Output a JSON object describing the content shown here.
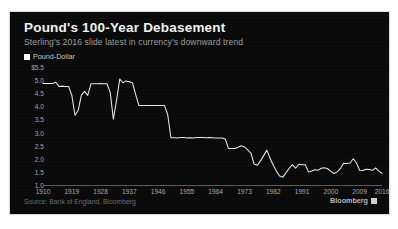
{
  "header": {
    "title": "Pound's 100-Year Debasement",
    "subtitle": "Sterling's 2016 slide latest in currency's downward trend"
  },
  "legend": {
    "swatch_icon": "legend-square-icon",
    "label": "Pound-Dollar",
    "color": "#ffffff"
  },
  "footer": {
    "source": "Source: Bank of England, Bloomberg",
    "brand": "Bloomberg",
    "brand_mark_icon": "bloomberg-square-icon"
  },
  "colors": {
    "panel_background": "#0a0a0a",
    "page_background": "#ffffff",
    "line": "#e8e8e2",
    "axis": "#5a5a5a",
    "tick_text": "#a8a8a8",
    "title_text": "#f2f2f2",
    "subtitle_text": "#9d9d9d",
    "source_text": "#6d6d6d"
  },
  "chart_data": {
    "type": "line",
    "title": "Pound's 100-Year Debasement",
    "subtitle": "Sterling's 2016 slide latest in currency's downward trend",
    "xlabel": "",
    "ylabel": "",
    "xlim": [
      1910,
      2016
    ],
    "ylim": [
      1.0,
      5.5
    ],
    "grid": false,
    "legend_position": "top-left",
    "ytick_labels": [
      "$5.5",
      "5.0",
      "4.5",
      "4.0",
      "3.5",
      "3.0",
      "2.5",
      "2.0",
      "1.5",
      "1.0"
    ],
    "ytick_values": [
      5.5,
      5.0,
      4.5,
      4.0,
      3.5,
      3.0,
      2.5,
      2.0,
      1.5,
      1.0
    ],
    "xtick_labels": [
      "1910",
      "1919",
      "1928",
      "1937",
      "1946",
      "1955",
      "1964",
      "1973",
      "1982",
      "1991",
      "2000",
      "2009",
      "2016"
    ],
    "xtick_values": [
      1910,
      1919,
      1928,
      1937,
      1946,
      1955,
      1964,
      1973,
      1982,
      1991,
      2000,
      2009,
      2016
    ],
    "series": [
      {
        "name": "Pound-Dollar",
        "color": "#e8e8e2",
        "x": [
          1910,
          1911,
          1912,
          1913,
          1914,
          1915,
          1916,
          1917,
          1918,
          1919,
          1920,
          1921,
          1922,
          1923,
          1924,
          1925,
          1926,
          1927,
          1928,
          1929,
          1930,
          1931,
          1932,
          1933,
          1934,
          1935,
          1936,
          1937,
          1938,
          1939,
          1940,
          1941,
          1942,
          1943,
          1944,
          1945,
          1946,
          1947,
          1948,
          1949,
          1950,
          1951,
          1952,
          1953,
          1954,
          1955,
          1956,
          1957,
          1958,
          1959,
          1960,
          1961,
          1962,
          1963,
          1964,
          1965,
          1966,
          1967,
          1968,
          1969,
          1970,
          1971,
          1972,
          1973,
          1974,
          1975,
          1976,
          1977,
          1978,
          1979,
          1980,
          1981,
          1982,
          1983,
          1984,
          1985,
          1986,
          1987,
          1988,
          1989,
          1990,
          1991,
          1992,
          1993,
          1994,
          1995,
          1996,
          1997,
          1998,
          1999,
          2000,
          2001,
          2002,
          2003,
          2004,
          2005,
          2006,
          2007,
          2008,
          2009,
          2010,
          2011,
          2012,
          2013,
          2014,
          2015,
          2016
        ],
        "values": [
          4.87,
          4.87,
          4.87,
          4.87,
          4.92,
          4.76,
          4.77,
          4.76,
          4.76,
          4.43,
          3.66,
          3.85,
          4.43,
          4.57,
          4.42,
          4.86,
          4.86,
          4.86,
          4.87,
          4.86,
          4.86,
          4.54,
          3.51,
          4.24,
          5.04,
          4.9,
          4.97,
          4.94,
          4.89,
          4.44,
          4.03,
          4.03,
          4.03,
          4.03,
          4.03,
          4.03,
          4.03,
          4.03,
          4.03,
          3.68,
          2.8,
          2.8,
          2.79,
          2.81,
          2.81,
          2.79,
          2.8,
          2.79,
          2.81,
          2.81,
          2.81,
          2.8,
          2.81,
          2.8,
          2.79,
          2.79,
          2.79,
          2.75,
          2.39,
          2.39,
          2.39,
          2.44,
          2.5,
          2.45,
          2.34,
          2.22,
          1.8,
          1.75,
          1.92,
          2.12,
          2.33,
          2.02,
          1.75,
          1.52,
          1.34,
          1.3,
          1.47,
          1.64,
          1.78,
          1.64,
          1.79,
          1.77,
          1.77,
          1.5,
          1.53,
          1.58,
          1.56,
          1.64,
          1.66,
          1.62,
          1.52,
          1.44,
          1.5,
          1.63,
          1.83,
          1.82,
          1.84,
          2.0,
          1.85,
          1.56,
          1.55,
          1.6,
          1.59,
          1.56,
          1.65,
          1.53,
          1.45
        ],
        "notes": [
          "Flat near 4.87 gold-standard parity before WWI",
          "Post-WWI slide to ~3.66 in 1920, recovery to 4.86 at 1925 gold-standard return",
          "1931 exit from gold standard; fall to ~3.51 in 1932",
          "Wartime peg at 4.03 from 1940",
          "1949 devaluation step down to 2.80",
          "1967 devaluation step down to 2.39",
          "1970s float and decline, low ~1.75 in 1976",
          "1980 peak ~2.33, then collapse to all-time low ~1.30 in 1985",
          "Modern range roughly 1.40 to 2.00",
          "2016 slide ends near 1.45"
        ]
      }
    ]
  }
}
